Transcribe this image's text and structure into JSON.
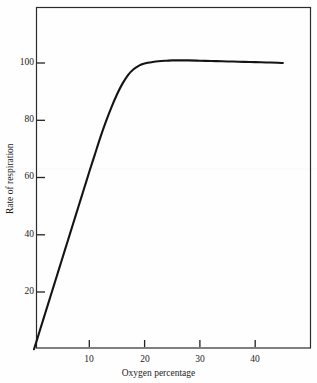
{
  "chart_data": {
    "type": "line",
    "title": "",
    "xlabel": "Oxygen percentage",
    "ylabel": "Rate of respiration",
    "xlim": [
      0,
      49.5
    ],
    "ylim": [
      0,
      121
    ],
    "xticks": [
      10,
      20,
      30,
      40
    ],
    "yticks": [
      20,
      40,
      60,
      80,
      100
    ],
    "xtick_labels": [
      "10",
      "20",
      "30",
      "40"
    ],
    "ytick_labels": [
      "20",
      "40",
      "60",
      "80",
      "100"
    ],
    "grid": false,
    "legend": null,
    "frame": "box",
    "series": [
      {
        "name": "Rate of respiration vs oxygen percentage",
        "color": "#141414",
        "linewidth": 2.1,
        "x": [
          0,
          1,
          2,
          3,
          4,
          5,
          6,
          7,
          8,
          9,
          10,
          11,
          12,
          13,
          14,
          15,
          16,
          17,
          18,
          19,
          20,
          21,
          22,
          23,
          24,
          25,
          26,
          28,
          30,
          32,
          34,
          36,
          38,
          40,
          42,
          44,
          45
        ],
        "y": [
          0,
          6.2,
          12.4,
          18.6,
          24.8,
          31,
          37.2,
          43.4,
          49.6,
          55.8,
          62,
          68,
          74,
          79.5,
          84.5,
          89,
          92.8,
          95.8,
          97.8,
          99.1,
          99.8,
          100.2,
          100.5,
          100.7,
          100.8,
          100.9,
          100.9,
          100.9,
          100.8,
          100.7,
          100.6,
          100.5,
          100.4,
          100.3,
          100.2,
          100.1,
          100.0
        ]
      }
    ],
    "annotations": []
  },
  "axis": {
    "x_title": "Oxygen percentage",
    "y_title": "Rate of respiration"
  }
}
